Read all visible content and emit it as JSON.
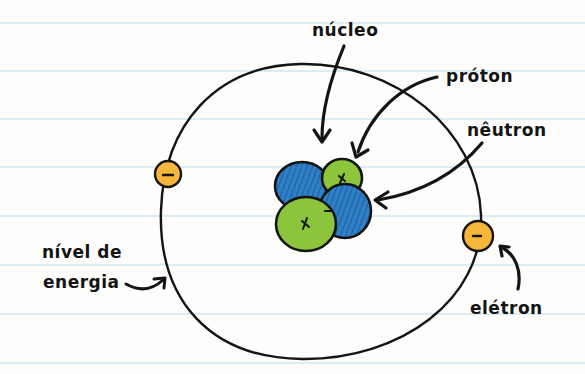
{
  "diagram": {
    "labels": {
      "nucleus": "núcleo",
      "proton": "próton",
      "neutron": "nêutron",
      "energy_level_line1": "nível de",
      "energy_level_line2": "energia",
      "electron": "elétron"
    },
    "colors": {
      "paper": "#fdfdfb",
      "rule_line": "#cfe6f0",
      "ink": "#141414",
      "proton": "#8cc43c",
      "neutron": "#2f7fc8",
      "electron": "#f5b73a"
    },
    "symbols": {
      "proton_charge": "+",
      "electron_charge": "−"
    },
    "rule_lines_y": [
      23,
      71,
      119,
      167,
      216,
      265,
      314,
      363
    ]
  }
}
